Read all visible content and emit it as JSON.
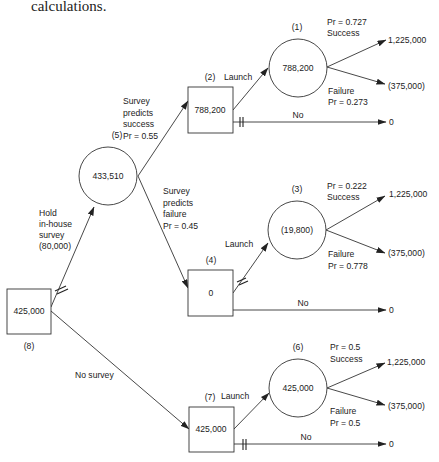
{
  "caption": "calculations.",
  "tree": {
    "root": {
      "id": "(8)",
      "type": "decision",
      "value": "425,000"
    },
    "survey_branch": {
      "label_lines": [
        "Hold",
        "in-house",
        "survey",
        "(80,000)"
      ]
    },
    "no_survey_branch": {
      "label": "No survey"
    },
    "node5": {
      "id": "(5)",
      "type": "chance",
      "value": "433,510"
    },
    "success_branch": {
      "label_lines": [
        "Survey",
        "predicts",
        "success",
        "Pr = 0.55"
      ]
    },
    "failure_branch": {
      "label_lines": [
        "Survey",
        "predicts",
        "failure",
        "Pr = 0.45"
      ]
    },
    "node2": {
      "id": "(2)",
      "type": "decision",
      "value": "788,200"
    },
    "node4": {
      "id": "(4)",
      "type": "decision",
      "value": "0"
    },
    "node7": {
      "id": "(7)",
      "type": "decision",
      "value": "425,000"
    },
    "node1": {
      "id": "(1)",
      "type": "chance",
      "value": "788,200",
      "success_pr": "Pr = 0.727",
      "success_label": "Success",
      "failure_label": "Failure",
      "failure_pr": "Pr = 0.273"
    },
    "node3": {
      "id": "(3)",
      "type": "chance",
      "value": "(19,800)",
      "success_pr": "Pr = 0.222",
      "success_label": "Success",
      "failure_label": "Failure",
      "failure_pr": "Pr = 0.778"
    },
    "node6": {
      "id": "(6)",
      "type": "chance",
      "value": "425,000",
      "success_pr": "Pr = 0.5",
      "success_label": "Success",
      "failure_label": "Failure",
      "failure_pr": "Pr = 0.5"
    },
    "launch_label": "Launch",
    "no_label": "No",
    "payoffs": {
      "success": "1,225,000",
      "failure": "(375,000)",
      "no": "0"
    }
  }
}
